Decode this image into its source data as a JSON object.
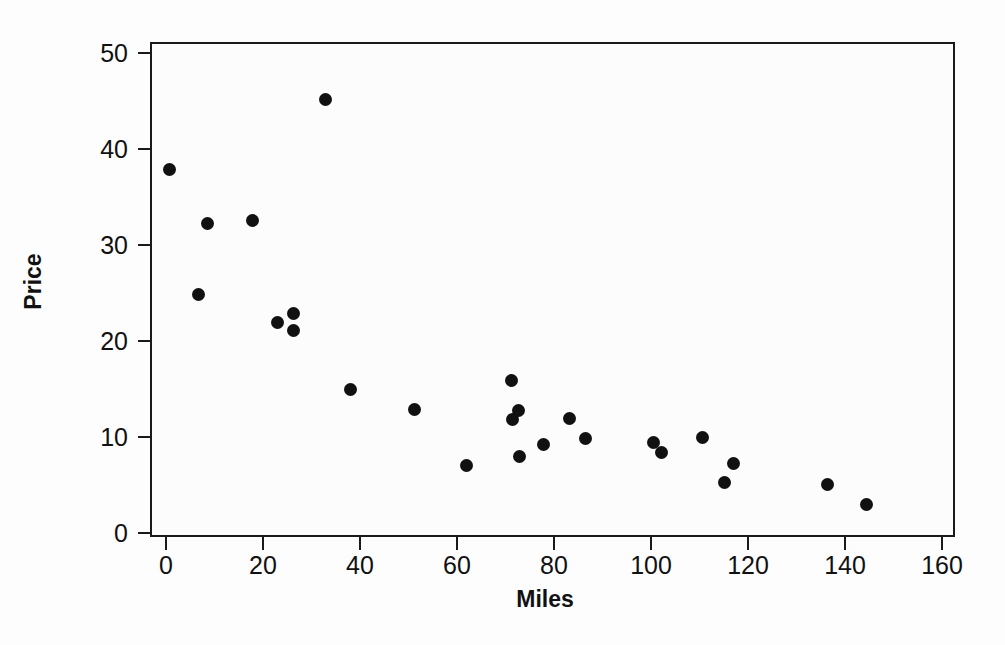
{
  "chart_data": {
    "type": "scatter",
    "title": "",
    "xlabel": "Miles",
    "ylabel": "Price",
    "xlim": [
      0,
      160
    ],
    "ylim": [
      0,
      50
    ],
    "xticks": [
      0,
      20,
      40,
      60,
      80,
      100,
      120,
      140,
      160
    ],
    "yticks": [
      0,
      10,
      20,
      30,
      40,
      50
    ],
    "xtick_labels": [
      "0",
      "20",
      "40",
      "60",
      "80",
      "100",
      "120",
      "140",
      "160"
    ],
    "ytick_labels": [
      "0",
      "10",
      "20",
      "30",
      "40",
      "50"
    ],
    "grid": false,
    "legend": null,
    "marker": {
      "shape": "circle",
      "color": "#111111",
      "size_px": 13
    },
    "frame_color": "#1a1a1a",
    "background_color": "#fcfcfc",
    "points": [
      {
        "x": 0.8,
        "y": 37.9
      },
      {
        "x": 6.8,
        "y": 24.8
      },
      {
        "x": 8.5,
        "y": 32.2
      },
      {
        "x": 17.9,
        "y": 32.6
      },
      {
        "x": 22.9,
        "y": 21.9
      },
      {
        "x": 26.2,
        "y": 22.9
      },
      {
        "x": 26.2,
        "y": 21.1
      },
      {
        "x": 32.8,
        "y": 45.2
      },
      {
        "x": 38.1,
        "y": 15.0
      },
      {
        "x": 51.3,
        "y": 12.9
      },
      {
        "x": 61.9,
        "y": 7.0
      },
      {
        "x": 71.3,
        "y": 15.9
      },
      {
        "x": 71.5,
        "y": 11.8
      },
      {
        "x": 72.6,
        "y": 12.8
      },
      {
        "x": 72.8,
        "y": 8.0
      },
      {
        "x": 77.9,
        "y": 9.2
      },
      {
        "x": 83.1,
        "y": 11.9
      },
      {
        "x": 86.4,
        "y": 9.8
      },
      {
        "x": 100.6,
        "y": 9.4
      },
      {
        "x": 102.1,
        "y": 8.4
      },
      {
        "x": 110.7,
        "y": 9.9
      },
      {
        "x": 115.1,
        "y": 5.3
      },
      {
        "x": 117.1,
        "y": 7.2
      },
      {
        "x": 136.3,
        "y": 5.1
      },
      {
        "x": 144.5,
        "y": 3.0
      }
    ]
  }
}
